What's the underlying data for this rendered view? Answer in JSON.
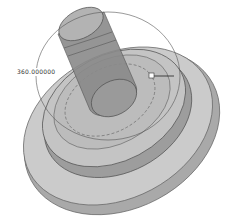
{
  "viewport": {
    "type": "cad-3d-view",
    "feature": "revolve-preview",
    "dimension": {
      "label": "360.000000",
      "unit": "deg"
    },
    "colors": {
      "background": "#ffffff",
      "body_light": "#c8c8c8",
      "body_mid": "#a8a8a8",
      "body_dark": "#7a7a7a",
      "edge": "#555555",
      "handle": "#ffffff"
    }
  }
}
